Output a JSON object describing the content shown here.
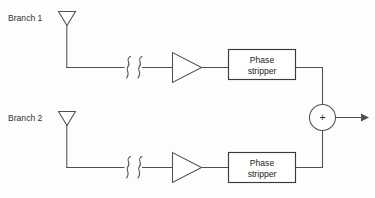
{
  "diagram": {
    "background_color": "#fdfdfd",
    "line_color": "#4f4f55",
    "text_color": "#1d1d20",
    "branches": [
      {
        "id": "branch-1",
        "label": "Branch 1",
        "antenna_icon": "antenna-icon",
        "line_break_icon": "transmission-line-break-icon",
        "amplifier_icon": "amplifier-icon",
        "block_label_line1": "Phase",
        "block_label_line2": "stripper"
      },
      {
        "id": "branch-2",
        "label": "Branch 2",
        "antenna_icon": "antenna-icon",
        "line_break_icon": "transmission-line-break-icon",
        "amplifier_icon": "amplifier-icon",
        "block_label_line1": "Phase",
        "block_label_line2": "stripper"
      }
    ],
    "combiner": {
      "label": "+",
      "icon": "summing-junction-icon"
    },
    "output": {
      "icon": "arrow-right-icon",
      "label": ""
    }
  }
}
